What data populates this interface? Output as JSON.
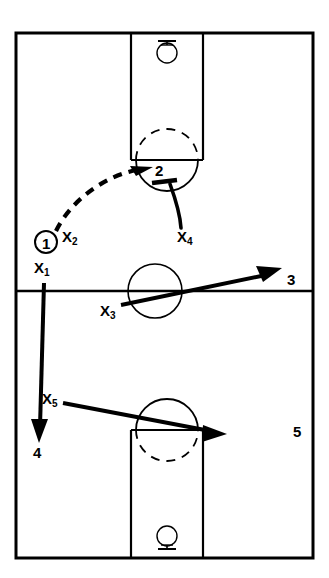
{
  "diagram": {
    "type": "basketball-play-diagram",
    "title": "",
    "sport": "basketball",
    "colors": {
      "line": "#000000",
      "background": "#ffffff"
    },
    "court": {
      "left": 16,
      "top": 33,
      "right": 313,
      "bottom": 558,
      "half_court_line_y": 291,
      "lane_left": 131,
      "lane_right": 203,
      "border_width": 3,
      "line_width": 2
    },
    "baskets": [
      {
        "name": "top-basket",
        "cx": 167,
        "cy": 52,
        "rim_radius": 10,
        "board_y": 41,
        "board_half_width": 9,
        "orientation": "down"
      },
      {
        "name": "bottom-basket",
        "cx": 167,
        "cy": 537,
        "rim_radius": 10,
        "board_y": 549,
        "board_half_width": 9,
        "orientation": "up"
      }
    ],
    "keys": [
      {
        "name": "top-key",
        "free_throw_line_y": 160,
        "circle_cx": 167,
        "circle_cy": 160,
        "circle_r": 31,
        "dashed_half": "top"
      },
      {
        "name": "bottom-key",
        "free_throw_line_y": 430,
        "circle_cx": 167,
        "circle_cy": 430,
        "circle_r": 31,
        "dashed_half": "bottom"
      }
    ],
    "center_circle": {
      "cx": 155,
      "cy": 291,
      "r": 27
    },
    "players": {
      "offense": [
        {
          "label": "1",
          "marker": "circle",
          "x": 46,
          "y": 242,
          "radius": 11,
          "has_ball": true
        },
        {
          "label": "2",
          "marker": "text",
          "x": 160,
          "y": 172
        },
        {
          "label": "3",
          "marker": "text",
          "x": 292,
          "y": 280
        },
        {
          "label": "4",
          "marker": "text",
          "x": 38,
          "y": 453
        },
        {
          "label": "5",
          "marker": "text",
          "x": 298,
          "y": 432
        }
      ],
      "defense": [
        {
          "label": "X",
          "sub": "1",
          "x": 38,
          "y": 268
        },
        {
          "label": "X",
          "sub": "2",
          "x": 66,
          "y": 236
        },
        {
          "label": "X",
          "sub": "3",
          "x": 104,
          "y": 310
        },
        {
          "label": "X",
          "sub": "4",
          "x": 181,
          "y": 236
        },
        {
          "label": "X",
          "sub": "5",
          "x": 46,
          "y": 398
        }
      ]
    },
    "movements": [
      {
        "name": "pass-1-to-2",
        "style": "dashed-arrow",
        "from": "1",
        "to": "2",
        "meaning": "pass"
      },
      {
        "name": "screen-x4",
        "style": "solid-line-with-bar",
        "from": "X4",
        "to": "2",
        "meaning": "screen"
      },
      {
        "name": "cut-x3",
        "style": "solid-arrow",
        "from": "X3",
        "to": "3",
        "meaning": "cut"
      },
      {
        "name": "cut-x1",
        "style": "solid-arrow",
        "from": "X1",
        "to": "4",
        "meaning": "cut"
      },
      {
        "name": "cut-x5",
        "style": "solid-arrow",
        "from": "X5",
        "to": "5",
        "meaning": "cut"
      }
    ]
  }
}
